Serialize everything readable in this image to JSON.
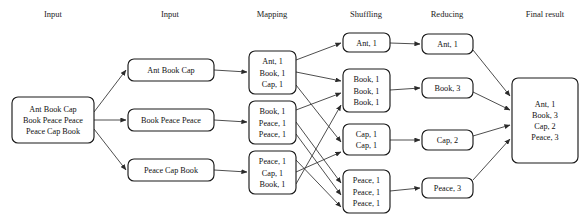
{
  "diagram": {
    "colors": {
      "background": "#ffffff",
      "box_stroke": "#1a1a1a",
      "box_fill": "#ffffff",
      "text": "#111111",
      "header_text": "#222222",
      "edge": "#3a3a3a"
    },
    "headers": [
      {
        "label": "Input",
        "x": 53
      },
      {
        "label": "Input",
        "x": 170
      },
      {
        "label": "Mapping",
        "x": 272
      },
      {
        "label": "Shuffling",
        "x": 366
      },
      {
        "label": "Reducing",
        "x": 447
      },
      {
        "label": "Final result",
        "x": 545
      }
    ],
    "stages": {
      "input": {
        "name": "input",
        "boxes": [
          {
            "id": "input-0",
            "x": 12,
            "y": 97,
            "w": 82,
            "h": 46,
            "lines": [
              "Ant Book Cap",
              "Book Peace Peace",
              "Peace Cap Book"
            ]
          }
        ]
      },
      "split": {
        "name": "split-input",
        "boxes": [
          {
            "id": "split-0",
            "x": 128,
            "y": 59,
            "w": 86,
            "h": 22,
            "lines": [
              "Ant Book Cap"
            ]
          },
          {
            "id": "split-1",
            "x": 128,
            "y": 109,
            "w": 86,
            "h": 22,
            "lines": [
              "Book Peace Peace"
            ]
          },
          {
            "id": "split-2",
            "x": 128,
            "y": 159,
            "w": 86,
            "h": 22,
            "lines": [
              "Peace Cap Book"
            ]
          }
        ]
      },
      "mapping": {
        "name": "mapping",
        "boxes": [
          {
            "id": "map-0",
            "x": 249,
            "y": 51,
            "w": 47,
            "h": 43,
            "lines": [
              "Ant, 1",
              "Book, 1",
              "Cap, 1"
            ]
          },
          {
            "id": "map-1",
            "x": 249,
            "y": 101,
            "w": 47,
            "h": 43,
            "lines": [
              "Book, 1",
              "Peace, 1",
              "Peace, 1"
            ]
          },
          {
            "id": "map-2",
            "x": 249,
            "y": 151,
            "w": 47,
            "h": 43,
            "lines": [
              "Peace, 1",
              "Cap, 1",
              "Book, 1"
            ]
          }
        ]
      },
      "shuffling": {
        "name": "shuffling",
        "boxes": [
          {
            "id": "shuf-0",
            "x": 343,
            "y": 33,
            "w": 47,
            "h": 19,
            "lines": [
              "Ant, 1"
            ]
          },
          {
            "id": "shuf-1",
            "x": 343,
            "y": 69,
            "w": 47,
            "h": 43,
            "lines": [
              "Book, 1",
              "Book, 1",
              "Book, 1"
            ]
          },
          {
            "id": "shuf-2",
            "x": 343,
            "y": 124,
            "w": 47,
            "h": 31,
            "lines": [
              "Cap, 1",
              "Cap, 1"
            ]
          },
          {
            "id": "shuf-3",
            "x": 343,
            "y": 170,
            "w": 47,
            "h": 43,
            "lines": [
              "Peace, 1",
              "Peace, 1",
              "Peace, 1"
            ]
          }
        ]
      },
      "reducing": {
        "name": "reducing",
        "boxes": [
          {
            "id": "red-0",
            "x": 422,
            "y": 34,
            "w": 51,
            "h": 20,
            "lines": [
              "Ant, 1"
            ]
          },
          {
            "id": "red-1",
            "x": 422,
            "y": 78,
            "w": 51,
            "h": 20,
            "lines": [
              "Book, 3"
            ]
          },
          {
            "id": "red-2",
            "x": 422,
            "y": 130,
            "w": 51,
            "h": 20,
            "lines": [
              "Cap, 2"
            ]
          },
          {
            "id": "red-3",
            "x": 422,
            "y": 178,
            "w": 51,
            "h": 20,
            "lines": [
              "Peace, 3"
            ]
          }
        ]
      },
      "final": {
        "name": "final-result",
        "boxes": [
          {
            "id": "final-0",
            "x": 512,
            "y": 78,
            "w": 66,
            "h": 85,
            "lines": [
              "Ant, 1",
              "Book, 3",
              "Cap, 2",
              "Peace, 3"
            ]
          }
        ]
      }
    },
    "edges": [
      {
        "from": "input-0",
        "to": "split-0",
        "x1": 94,
        "y1": 112,
        "x2": 126,
        "y2": 70
      },
      {
        "from": "input-0",
        "to": "split-1",
        "x1": 94,
        "y1": 120,
        "x2": 126,
        "y2": 120
      },
      {
        "from": "input-0",
        "to": "split-2",
        "x1": 94,
        "y1": 129,
        "x2": 126,
        "y2": 170
      },
      {
        "from": "split-0",
        "to": "map-0",
        "x1": 214,
        "y1": 70,
        "x2": 247,
        "y2": 72
      },
      {
        "from": "split-1",
        "to": "map-1",
        "x1": 214,
        "y1": 120,
        "x2": 247,
        "y2": 122
      },
      {
        "from": "split-2",
        "to": "map-2",
        "x1": 214,
        "y1": 170,
        "x2": 247,
        "y2": 172
      },
      {
        "from": "map-0",
        "to": "shuf-0",
        "x1": 296,
        "y1": 60,
        "x2": 341,
        "y2": 43
      },
      {
        "from": "map-0",
        "to": "shuf-1",
        "x1": 296,
        "y1": 72,
        "x2": 341,
        "y2": 81
      },
      {
        "from": "map-0",
        "to": "shuf-2",
        "x1": 296,
        "y1": 85,
        "x2": 341,
        "y2": 142
      },
      {
        "from": "map-1",
        "to": "shuf-1",
        "x1": 296,
        "y1": 110,
        "x2": 341,
        "y2": 93
      },
      {
        "from": "map-1",
        "to": "shuf-3",
        "x1": 296,
        "y1": 122,
        "x2": 341,
        "y2": 183
      },
      {
        "from": "map-1",
        "to": "shuf-3",
        "x1": 296,
        "y1": 134,
        "x2": 341,
        "y2": 195
      },
      {
        "from": "map-2",
        "to": "shuf-3",
        "x1": 296,
        "y1": 160,
        "x2": 341,
        "y2": 207
      },
      {
        "from": "map-2",
        "to": "shuf-2",
        "x1": 296,
        "y1": 172,
        "x2": 341,
        "y2": 152
      },
      {
        "from": "map-2",
        "to": "shuf-1",
        "x1": 296,
        "y1": 184,
        "x2": 341,
        "y2": 105
      },
      {
        "from": "shuf-0",
        "to": "red-0",
        "x1": 390,
        "y1": 43,
        "x2": 420,
        "y2": 44
      },
      {
        "from": "shuf-1",
        "to": "red-1",
        "x1": 390,
        "y1": 90,
        "x2": 420,
        "y2": 88
      },
      {
        "from": "shuf-2",
        "to": "red-2",
        "x1": 390,
        "y1": 140,
        "x2": 420,
        "y2": 140
      },
      {
        "from": "shuf-3",
        "to": "red-3",
        "x1": 390,
        "y1": 191,
        "x2": 420,
        "y2": 188
      },
      {
        "from": "red-0",
        "to": "final-0",
        "x1": 473,
        "y1": 50,
        "x2": 510,
        "y2": 96
      },
      {
        "from": "red-1",
        "to": "final-0",
        "x1": 473,
        "y1": 92,
        "x2": 510,
        "y2": 110
      },
      {
        "from": "red-2",
        "to": "final-0",
        "x1": 473,
        "y1": 136,
        "x2": 510,
        "y2": 125
      },
      {
        "from": "red-3",
        "to": "final-0",
        "x1": 473,
        "y1": 180,
        "x2": 510,
        "y2": 139
      }
    ]
  }
}
